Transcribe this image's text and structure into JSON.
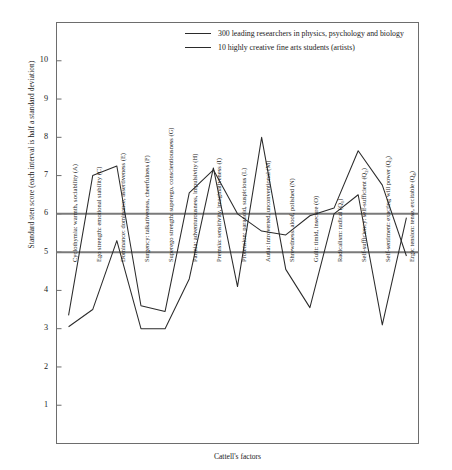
{
  "chart_data": {
    "type": "line",
    "title": "",
    "xlabel": "Cattell's factors",
    "ylabel": "Standard sten score (each interval is half a standard deviation)",
    "ylim": [
      0,
      11
    ],
    "yticks": [
      1,
      2,
      3,
      4,
      5,
      6,
      7,
      8,
      9,
      10
    ],
    "grid": false,
    "legend_position": "top-center",
    "reference_lines": [
      {
        "value": 6,
        "color": "#7a7a7a"
      },
      {
        "value": 5,
        "color": "#7a7a7a"
      }
    ],
    "categories": [
      "Cyclothymia: warmth, sociability (A)",
      "Ego strength: emotional stability (C)",
      "Dominance: dominance, assertiveness (E)",
      "Surgency: talkativeness, cheerfulness (F)",
      "Superego strength: superego, conscientiousness (G)",
      "Parmia: adventurousness, impulsivity (H)",
      "Premsia: sensitivity, imaginativeness (I)",
      "Protension: paranoid, suspicious (L)",
      "Autia: introverted, unconventional (M)",
      "Shrewdness: aloof, polished (N)",
      "Guilt: timid, insecure (O)",
      "Radicalism: radical (Q1)",
      "Self-sufficiency: self-sufficient (Q2)",
      "Self-sentiment: exacting will power (Q3)",
      "Ergic tension: tense, excitable (Q4)"
    ],
    "category_codes": [
      "A",
      "C",
      "E",
      "F",
      "G",
      "H",
      "I",
      "L",
      "M",
      "N",
      "O",
      "Q1",
      "Q2",
      "Q3",
      "Q4"
    ],
    "series": [
      {
        "name": "300 leading researchers in physics, psychology and biology",
        "color": "#2b2b2b",
        "values": [
          3.35,
          7.0,
          7.25,
          3.6,
          3.45,
          6.55,
          7.15,
          6.0,
          5.55,
          5.45,
          5.95,
          6.15,
          7.65,
          6.75,
          4.9
        ]
      },
      {
        "name": "10 highly creative fine arts students (artists)",
        "color": "#2b2b2b",
        "values": [
          3.05,
          3.5,
          5.3,
          3.0,
          3.0,
          4.3,
          7.2,
          4.1,
          8.0,
          4.55,
          3.55,
          6.0,
          6.5,
          3.1,
          5.9
        ]
      }
    ]
  },
  "legend": {
    "entries": [
      "300 leading researchers in physics, psychology and biology",
      "10 highly creative fine arts students (artists)"
    ]
  },
  "axis": {
    "y_title": "Standard sten score (each interval is half a standard deviation)",
    "x_title": "Cattell's factors",
    "y_tick_labels": [
      "10",
      "9",
      "8",
      "7",
      "6",
      "5",
      "4",
      "3",
      "2",
      "1"
    ]
  }
}
